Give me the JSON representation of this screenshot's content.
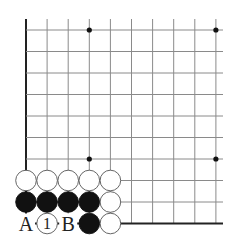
{
  "diagram": {
    "type": "go-board-corner",
    "corner": "bottom-left",
    "grid": {
      "columns": 10,
      "rows": 10,
      "x0": 26,
      "y0": 30,
      "spacing_x": 21.1,
      "spacing_y": 21.5,
      "line_color": "#8a8a8a",
      "edge_color": "#222222"
    },
    "star_points": [
      {
        "col": 3,
        "row": 0
      },
      {
        "col": 9,
        "row": 0
      },
      {
        "col": 3,
        "row": 6
      },
      {
        "col": 9,
        "row": 6
      }
    ],
    "stones": [
      {
        "col": 0,
        "row": 7,
        "color": "white"
      },
      {
        "col": 1,
        "row": 7,
        "color": "white"
      },
      {
        "col": 2,
        "row": 7,
        "color": "white"
      },
      {
        "col": 3,
        "row": 7,
        "color": "white"
      },
      {
        "col": 4,
        "row": 7,
        "color": "white"
      },
      {
        "col": 0,
        "row": 8,
        "color": "black"
      },
      {
        "col": 1,
        "row": 8,
        "color": "black"
      },
      {
        "col": 2,
        "row": 8,
        "color": "black"
      },
      {
        "col": 3,
        "row": 8,
        "color": "black"
      },
      {
        "col": 4,
        "row": 8,
        "color": "white"
      },
      {
        "col": 1,
        "row": 9,
        "color": "white",
        "label": "1"
      },
      {
        "col": 3,
        "row": 9,
        "color": "black"
      },
      {
        "col": 4,
        "row": 9,
        "color": "white"
      }
    ],
    "point_labels": [
      {
        "col": 0,
        "row": 9,
        "text": "A"
      },
      {
        "col": 2,
        "row": 9,
        "text": "B"
      }
    ]
  }
}
